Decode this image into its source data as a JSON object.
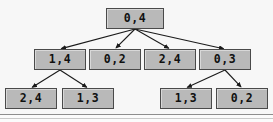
{
  "figure": {
    "width": 273,
    "height": 122,
    "background_color": "#f7f7f7",
    "node_fill_color": "#b9b9b9",
    "node_border_color": "#4a4a4a",
    "edge_color": "#1a1a1a",
    "text_color": "#111111",
    "divider_color": "#8d8d8d"
  },
  "chart_data": {
    "type": "diagram",
    "title": "",
    "xlabel": "",
    "ylabel": "",
    "levels": 3,
    "nodes": [
      {
        "id": "n0",
        "label": "0,4",
        "level": 0,
        "x": 106,
        "y": 8,
        "w": 58,
        "h": 21
      },
      {
        "id": "n1",
        "label": "1,4",
        "level": 1,
        "x": 34,
        "y": 49,
        "w": 52,
        "h": 21
      },
      {
        "id": "n2",
        "label": "0,2",
        "level": 1,
        "x": 89,
        "y": 49,
        "w": 52,
        "h": 21
      },
      {
        "id": "n3",
        "label": "2,4",
        "level": 1,
        "x": 144,
        "y": 49,
        "w": 52,
        "h": 21
      },
      {
        "id": "n4",
        "label": "0,3",
        "level": 1,
        "x": 199,
        "y": 49,
        "w": 52,
        "h": 21
      },
      {
        "id": "n5",
        "label": "2,4",
        "level": 2,
        "x": 5,
        "y": 88,
        "w": 52,
        "h": 21
      },
      {
        "id": "n6",
        "label": "1,3",
        "level": 2,
        "x": 62,
        "y": 88,
        "w": 52,
        "h": 21
      },
      {
        "id": "n7",
        "label": "1,3",
        "level": 2,
        "x": 160,
        "y": 88,
        "w": 52,
        "h": 21
      },
      {
        "id": "n8",
        "label": "0,2",
        "level": 2,
        "x": 216,
        "y": 88,
        "w": 52,
        "h": 21
      }
    ],
    "edges": [
      {
        "from": "n0",
        "to": "n1"
      },
      {
        "from": "n0",
        "to": "n2"
      },
      {
        "from": "n0",
        "to": "n3"
      },
      {
        "from": "n0",
        "to": "n4"
      },
      {
        "from": "n1",
        "to": "n5"
      },
      {
        "from": "n1",
        "to": "n6"
      },
      {
        "from": "n4",
        "to": "n7"
      },
      {
        "from": "n4",
        "to": "n8"
      }
    ]
  }
}
